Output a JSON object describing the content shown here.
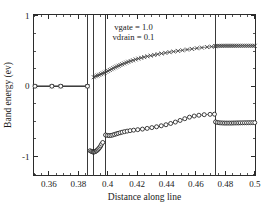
{
  "chart_data": {
    "type": "line",
    "title": "",
    "xlabel": "Distance along line",
    "ylabel": "Band energy (ev)",
    "xlim": [
      0.3495,
      0.5005
    ],
    "ylim": [
      -1.27,
      1.02
    ],
    "grid": false,
    "legend_position": "none",
    "x_major_ticks": [
      0.36,
      0.38,
      0.4,
      0.42,
      0.44,
      0.46,
      0.48,
      0.5
    ],
    "x_major_tick_labels": [
      "0.36",
      "0.38",
      "0.4",
      "0.42",
      "0.44",
      "0.46",
      "0.48",
      "0.5"
    ],
    "x_minor_tick_step": 0.005,
    "y_major_ticks": [
      1,
      0,
      -1
    ],
    "y_major_tick_labels": [
      "1",
      "0",
      "-1"
    ],
    "y_minor_tick_step": 0.25,
    "annotations": [
      {
        "text": "vgate = 1.0",
        "x": 0.4175,
        "y": 0.8
      },
      {
        "text": "vdrain = 0.1",
        "x": 0.4175,
        "y": 0.66
      }
    ],
    "vertical_reference_lines": [
      0.3862,
      0.3903,
      0.3985,
      0.4733
    ],
    "series": [
      {
        "name": "conduction-band",
        "marker": "x",
        "color": "#3c3c3c",
        "points": [
          [
            0.3505,
            0.0
          ],
          [
            0.362,
            0.0
          ],
          [
            0.368,
            0.0
          ],
          [
            0.3862,
            0.0
          ]
        ]
      },
      {
        "name": "valence-band",
        "marker": "circle",
        "color": "#1f1f1f",
        "points": [
          [
            0.3505,
            0.0
          ],
          [
            0.362,
            0.0
          ],
          [
            0.368,
            0.0
          ],
          [
            0.3862,
            0.0
          ]
        ]
      },
      {
        "name": "conduction-band-channel",
        "marker": "x",
        "color": "#3c3c3c",
        "points": [
          [
            0.3905,
            0.128
          ],
          [
            0.3918,
            0.142
          ],
          [
            0.393,
            0.152
          ],
          [
            0.3942,
            0.162
          ],
          [
            0.3954,
            0.172
          ],
          [
            0.3966,
            0.182
          ],
          [
            0.3978,
            0.193
          ],
          [
            0.399,
            0.205
          ],
          [
            0.4002,
            0.218
          ],
          [
            0.4014,
            0.231
          ],
          [
            0.4026,
            0.243
          ],
          [
            0.4038,
            0.256
          ],
          [
            0.405,
            0.268
          ],
          [
            0.4062,
            0.28
          ],
          [
            0.4074,
            0.291
          ],
          [
            0.4086,
            0.302
          ],
          [
            0.4098,
            0.313
          ],
          [
            0.4112,
            0.324
          ],
          [
            0.4126,
            0.336
          ],
          [
            0.414,
            0.347
          ],
          [
            0.4156,
            0.358
          ],
          [
            0.4172,
            0.369
          ],
          [
            0.419,
            0.381
          ],
          [
            0.4208,
            0.392
          ],
          [
            0.4228,
            0.403
          ],
          [
            0.4248,
            0.414
          ],
          [
            0.427,
            0.425
          ],
          [
            0.4292,
            0.435
          ],
          [
            0.4316,
            0.445
          ],
          [
            0.434,
            0.455
          ],
          [
            0.4366,
            0.465
          ],
          [
            0.4392,
            0.474
          ],
          [
            0.442,
            0.484
          ],
          [
            0.4448,
            0.493
          ],
          [
            0.4478,
            0.502
          ],
          [
            0.4508,
            0.511
          ],
          [
            0.454,
            0.521
          ],
          [
            0.4572,
            0.53
          ],
          [
            0.4606,
            0.54
          ],
          [
            0.464,
            0.549
          ],
          [
            0.4676,
            0.557
          ],
          [
            0.4706,
            0.563
          ],
          [
            0.4733,
            0.568
          ]
        ]
      },
      {
        "name": "conduction-band-drain",
        "marker": "x",
        "color": "#3c3c3c",
        "points": [
          [
            0.4733,
            0.572
          ],
          [
            0.4748,
            0.573
          ],
          [
            0.4762,
            0.574
          ],
          [
            0.4776,
            0.574
          ],
          [
            0.479,
            0.575
          ],
          [
            0.4804,
            0.575
          ],
          [
            0.4818,
            0.575
          ],
          [
            0.4832,
            0.575
          ],
          [
            0.4846,
            0.575
          ],
          [
            0.486,
            0.575
          ],
          [
            0.4874,
            0.575
          ],
          [
            0.4888,
            0.575
          ],
          [
            0.4902,
            0.575
          ],
          [
            0.4916,
            0.575
          ],
          [
            0.493,
            0.575
          ],
          [
            0.4944,
            0.575
          ],
          [
            0.4958,
            0.575
          ],
          [
            0.4972,
            0.575
          ],
          [
            0.4986,
            0.575
          ],
          [
            0.5,
            0.575
          ]
        ]
      },
      {
        "name": "valence-band-source",
        "marker": "circle",
        "color": "#1f1f1f",
        "points": [
          [
            0.388,
            -0.918
          ],
          [
            0.3889,
            -0.928
          ],
          [
            0.3897,
            -0.934
          ],
          [
            0.3903,
            -0.936
          ],
          [
            0.391,
            -0.934
          ],
          [
            0.3916,
            -0.928
          ],
          [
            0.3922,
            -0.92
          ],
          [
            0.3928,
            -0.91
          ],
          [
            0.3934,
            -0.898
          ],
          [
            0.394,
            -0.884
          ],
          [
            0.3946,
            -0.868
          ],
          [
            0.3952,
            -0.848
          ],
          [
            0.3958,
            -0.824
          ],
          [
            0.3966,
            -0.8
          ]
        ]
      },
      {
        "name": "valence-band-channel",
        "marker": "circle",
        "color": "#1f1f1f",
        "points": [
          [
            0.3985,
            -0.694
          ],
          [
            0.3998,
            -0.7
          ],
          [
            0.401,
            -0.702
          ],
          [
            0.4022,
            -0.7
          ],
          [
            0.4034,
            -0.694
          ],
          [
            0.4046,
            -0.686
          ],
          [
            0.4058,
            -0.678
          ],
          [
            0.407,
            -0.67
          ],
          [
            0.4084,
            -0.662
          ],
          [
            0.4098,
            -0.654
          ],
          [
            0.4114,
            -0.646
          ],
          [
            0.4132,
            -0.639
          ],
          [
            0.4152,
            -0.632
          ],
          [
            0.4176,
            -0.625
          ],
          [
            0.4204,
            -0.618
          ],
          [
            0.4236,
            -0.61
          ],
          [
            0.4268,
            -0.6
          ],
          [
            0.43,
            -0.589
          ],
          [
            0.4332,
            -0.577
          ],
          [
            0.4364,
            -0.563
          ],
          [
            0.4396,
            -0.548
          ],
          [
            0.4428,
            -0.53
          ],
          [
            0.446,
            -0.51
          ],
          [
            0.4492,
            -0.487
          ],
          [
            0.4524,
            -0.462
          ],
          [
            0.4556,
            -0.44
          ],
          [
            0.4588,
            -0.424
          ],
          [
            0.462,
            -0.413
          ],
          [
            0.4656,
            -0.405
          ],
          [
            0.4696,
            -0.4
          ],
          [
            0.4726,
            -0.398
          ]
        ]
      },
      {
        "name": "valence-band-drain",
        "marker": "circle",
        "color": "#1f1f1f",
        "points": [
          [
            0.4733,
            -0.508
          ],
          [
            0.4746,
            -0.516
          ],
          [
            0.4758,
            -0.52
          ],
          [
            0.477,
            -0.522
          ],
          [
            0.4782,
            -0.523
          ],
          [
            0.4794,
            -0.524
          ],
          [
            0.4806,
            -0.524
          ],
          [
            0.4818,
            -0.524
          ],
          [
            0.483,
            -0.524
          ],
          [
            0.4842,
            -0.524
          ],
          [
            0.4854,
            -0.523
          ],
          [
            0.4866,
            -0.523
          ],
          [
            0.4878,
            -0.522
          ],
          [
            0.489,
            -0.522
          ],
          [
            0.4902,
            -0.521
          ],
          [
            0.4916,
            -0.521
          ],
          [
            0.493,
            -0.52
          ],
          [
            0.4944,
            -0.52
          ],
          [
            0.4958,
            -0.519
          ],
          [
            0.4972,
            -0.519
          ],
          [
            0.4986,
            -0.518
          ],
          [
            0.5,
            -0.518
          ]
        ]
      }
    ]
  }
}
